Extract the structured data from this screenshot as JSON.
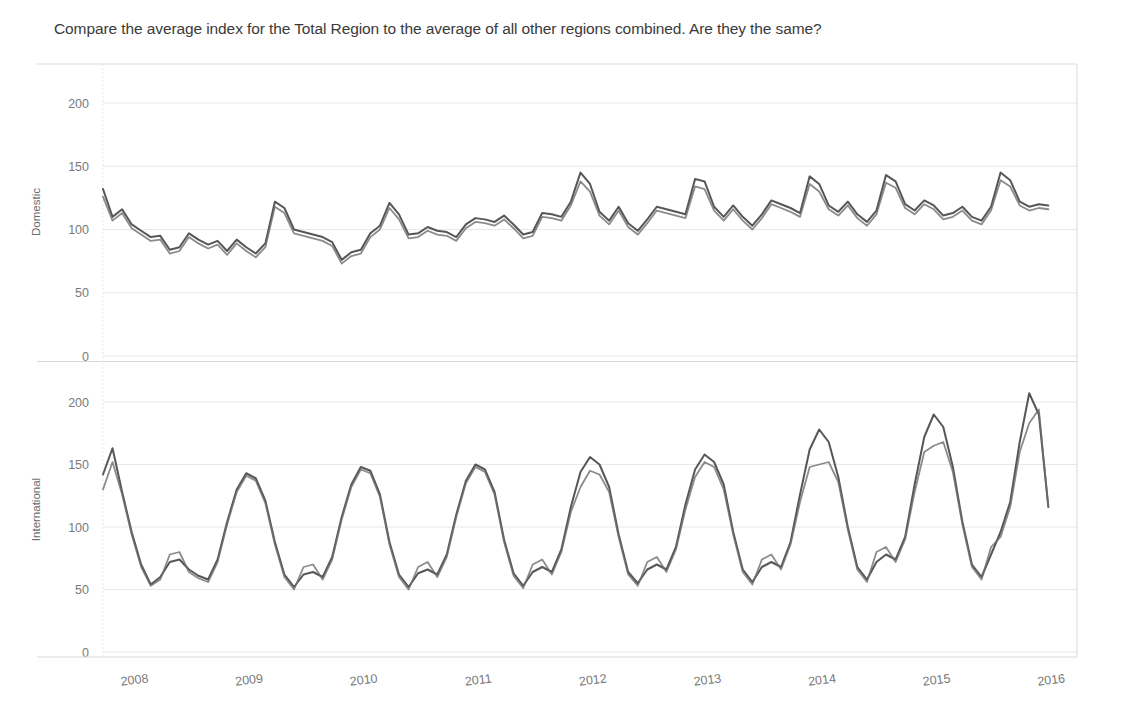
{
  "question": {
    "text": "Compare the average index for the Total Region to the average of all other regions combined. Are they the same?"
  },
  "colors": {
    "series_total": "#4d4d4d",
    "series_other": "#6e6e6e",
    "gridline": "#e8e8e8",
    "axis_line": "#d9d9d9",
    "tick_text": "#7a7a7a",
    "background": "#ffffff"
  },
  "chart_data": {
    "type": "line",
    "title": "",
    "xlabel": "",
    "grid": true,
    "legend_position": "none",
    "x_tick_labels": [
      "2008",
      "2009",
      "2010",
      "2011",
      "2012",
      "2013",
      "2014",
      "2015",
      "2016"
    ],
    "x_tick_values": [
      2008,
      2009,
      2010,
      2011,
      2012,
      2013,
      2014,
      2015,
      2016
    ],
    "xlim": [
      2008.0,
      2016.5
    ],
    "panels": [
      {
        "ylabel": "Domestic",
        "ylim": [
          0,
          225
        ],
        "y_tick_labels": [
          "0",
          "50",
          "100",
          "150",
          "200"
        ],
        "y_tick_values": [
          0,
          50,
          100,
          150,
          200
        ],
        "series": [
          {
            "name": "Total Region",
            "color": "#4d4d4d",
            "x": [
              2008.0,
              2008.083,
              2008.167,
              2008.25,
              2008.333,
              2008.417,
              2008.5,
              2008.583,
              2008.667,
              2008.75,
              2008.833,
              2008.917,
              2009.0,
              2009.083,
              2009.167,
              2009.25,
              2009.333,
              2009.417,
              2009.5,
              2009.583,
              2009.667,
              2009.75,
              2009.833,
              2009.917,
              2010.0,
              2010.083,
              2010.167,
              2010.25,
              2010.333,
              2010.417,
              2010.5,
              2010.583,
              2010.667,
              2010.75,
              2010.833,
              2010.917,
              2011.0,
              2011.083,
              2011.167,
              2011.25,
              2011.333,
              2011.417,
              2011.5,
              2011.583,
              2011.667,
              2011.75,
              2011.833,
              2011.917,
              2012.0,
              2012.083,
              2012.167,
              2012.25,
              2012.333,
              2012.417,
              2012.5,
              2012.583,
              2012.667,
              2012.75,
              2012.833,
              2012.917,
              2013.0,
              2013.083,
              2013.167,
              2013.25,
              2013.333,
              2013.417,
              2013.5,
              2013.583,
              2013.667,
              2013.75,
              2013.833,
              2013.917,
              2014.0,
              2014.083,
              2014.167,
              2014.25,
              2014.333,
              2014.417,
              2014.5,
              2014.583,
              2014.667,
              2014.75,
              2014.833,
              2014.917,
              2015.0,
              2015.083,
              2015.167,
              2015.25,
              2015.333,
              2015.417,
              2015.5,
              2015.583,
              2015.667,
              2015.75,
              2015.833,
              2015.917,
              2016.0,
              2016.083,
              2016.167,
              2016.25
            ],
            "values": [
              132,
              110,
              116,
              104,
              99,
              94,
              95,
              84,
              86,
              97,
              92,
              88,
              91,
              83,
              92,
              86,
              81,
              89,
              122,
              117,
              100,
              98,
              96,
              94,
              90,
              76,
              82,
              84,
              97,
              103,
              121,
              112,
              96,
              97,
              102,
              99,
              98,
              94,
              104,
              109,
              108,
              106,
              111,
              104,
              96,
              98,
              113,
              112,
              110,
              122,
              145,
              136,
              114,
              107,
              118,
              105,
              99,
              108,
              118,
              116,
              114,
              112,
              140,
              138,
              118,
              110,
              119,
              110,
              103,
              112,
              123,
              120,
              117,
              113,
              142,
              136,
              119,
              114,
              122,
              112,
              106,
              115,
              143,
              138,
              120,
              115,
              123,
              119,
              111,
              113,
              118,
              110,
              107,
              118,
              145,
              139,
              122,
              118,
              120,
              119
            ]
          },
          {
            "name": "All Other Regions",
            "color": "#6e6e6e",
            "x": [
              2008.0,
              2008.083,
              2008.167,
              2008.25,
              2008.333,
              2008.417,
              2008.5,
              2008.583,
              2008.667,
              2008.75,
              2008.833,
              2008.917,
              2009.0,
              2009.083,
              2009.167,
              2009.25,
              2009.333,
              2009.417,
              2009.5,
              2009.583,
              2009.667,
              2009.75,
              2009.833,
              2009.917,
              2010.0,
              2010.083,
              2010.167,
              2010.25,
              2010.333,
              2010.417,
              2010.5,
              2010.583,
              2010.667,
              2010.75,
              2010.833,
              2010.917,
              2011.0,
              2011.083,
              2011.167,
              2011.25,
              2011.333,
              2011.417,
              2011.5,
              2011.583,
              2011.667,
              2011.75,
              2011.833,
              2011.917,
              2012.0,
              2012.083,
              2012.167,
              2012.25,
              2012.333,
              2012.417,
              2012.5,
              2012.583,
              2012.667,
              2012.75,
              2012.833,
              2012.917,
              2013.0,
              2013.083,
              2013.167,
              2013.25,
              2013.333,
              2013.417,
              2013.5,
              2013.583,
              2013.667,
              2013.75,
              2013.833,
              2013.917,
              2014.0,
              2014.083,
              2014.167,
              2014.25,
              2014.333,
              2014.417,
              2014.5,
              2014.583,
              2014.667,
              2014.75,
              2014.833,
              2014.917,
              2015.0,
              2015.083,
              2015.167,
              2015.25,
              2015.333,
              2015.417,
              2015.5,
              2015.583,
              2015.667,
              2015.75,
              2015.833,
              2015.917,
              2016.0,
              2016.083,
              2016.167,
              2016.25
            ],
            "values": [
              126,
              107,
              113,
              101,
              96,
              91,
              92,
              81,
              83,
              94,
              89,
              85,
              88,
              80,
              89,
              83,
              78,
              86,
              118,
              113,
              97,
              95,
              93,
              91,
              87,
              73,
              79,
              81,
              94,
              100,
              117,
              108,
              93,
              94,
              99,
              96,
              95,
              91,
              101,
              106,
              105,
              103,
              108,
              101,
              93,
              95,
              110,
              109,
              107,
              119,
              138,
              130,
              111,
              104,
              115,
              102,
              96,
              105,
              115,
              113,
              111,
              109,
              134,
              132,
              115,
              107,
              116,
              107,
              100,
              109,
              120,
              117,
              114,
              110,
              136,
              130,
              116,
              111,
              119,
              109,
              103,
              112,
              137,
              133,
              117,
              112,
              120,
              116,
              108,
              110,
              115,
              107,
              104,
              115,
              139,
              134,
              119,
              115,
              117,
              116
            ]
          }
        ]
      },
      {
        "ylabel": "International",
        "ylim": [
          0,
          225
        ],
        "y_tick_labels": [
          "0",
          "50",
          "100",
          "150",
          "200"
        ],
        "y_tick_values": [
          0,
          50,
          100,
          150,
          200
        ],
        "series": [
          {
            "name": "Total Region",
            "color": "#4d4d4d",
            "x": [
              2008.0,
              2008.083,
              2008.167,
              2008.25,
              2008.333,
              2008.417,
              2008.5,
              2008.583,
              2008.667,
              2008.75,
              2008.833,
              2008.917,
              2009.0,
              2009.083,
              2009.167,
              2009.25,
              2009.333,
              2009.417,
              2009.5,
              2009.583,
              2009.667,
              2009.75,
              2009.833,
              2009.917,
              2010.0,
              2010.083,
              2010.167,
              2010.25,
              2010.333,
              2010.417,
              2010.5,
              2010.583,
              2010.667,
              2010.75,
              2010.833,
              2010.917,
              2011.0,
              2011.083,
              2011.167,
              2011.25,
              2011.333,
              2011.417,
              2011.5,
              2011.583,
              2011.667,
              2011.75,
              2011.833,
              2011.917,
              2012.0,
              2012.083,
              2012.167,
              2012.25,
              2012.333,
              2012.417,
              2012.5,
              2012.583,
              2012.667,
              2012.75,
              2012.833,
              2012.917,
              2013.0,
              2013.083,
              2013.167,
              2013.25,
              2013.333,
              2013.417,
              2013.5,
              2013.583,
              2013.667,
              2013.75,
              2013.833,
              2013.917,
              2014.0,
              2014.083,
              2014.167,
              2014.25,
              2014.333,
              2014.417,
              2014.5,
              2014.583,
              2014.667,
              2014.75,
              2014.833,
              2014.917,
              2015.0,
              2015.083,
              2015.167,
              2015.25,
              2015.333,
              2015.417,
              2015.5,
              2015.583,
              2015.667,
              2015.75,
              2015.833,
              2015.917,
              2016.0,
              2016.083,
              2016.167,
              2016.25
            ],
            "values": [
              142,
              163,
              128,
              96,
              70,
              54,
              60,
              72,
              74,
              66,
              61,
              58,
              74,
              104,
              130,
              143,
              139,
              121,
              88,
              62,
              52,
              62,
              64,
              60,
              76,
              108,
              134,
              148,
              145,
              126,
              88,
              62,
              52,
              63,
              66,
              62,
              78,
              110,
              137,
              150,
              146,
              128,
              90,
              63,
              53,
              64,
              68,
              64,
              82,
              116,
              144,
              156,
              150,
              132,
              94,
              64,
              55,
              66,
              70,
              66,
              84,
              118,
              146,
              158,
              152,
              134,
              96,
              66,
              56,
              68,
              72,
              68,
              88,
              126,
              162,
              178,
              168,
              140,
              100,
              68,
              58,
              72,
              78,
              74,
              92,
              134,
              172,
              190,
              180,
              148,
              104,
              70,
              60,
              78,
              96,
              120,
              168,
              207,
              190,
              116
            ]
          },
          {
            "name": "All Other Regions",
            "color": "#6e6e6e",
            "x": [
              2008.0,
              2008.083,
              2008.167,
              2008.25,
              2008.333,
              2008.417,
              2008.5,
              2008.583,
              2008.667,
              2008.75,
              2008.833,
              2008.917,
              2009.0,
              2009.083,
              2009.167,
              2009.25,
              2009.333,
              2009.417,
              2009.5,
              2009.583,
              2009.667,
              2009.75,
              2009.833,
              2009.917,
              2010.0,
              2010.083,
              2010.167,
              2010.25,
              2010.333,
              2010.417,
              2010.5,
              2010.583,
              2010.667,
              2010.75,
              2010.833,
              2010.917,
              2011.0,
              2011.083,
              2011.167,
              2011.25,
              2011.333,
              2011.417,
              2011.5,
              2011.583,
              2011.667,
              2011.75,
              2011.833,
              2011.917,
              2012.0,
              2012.083,
              2012.167,
              2012.25,
              2012.333,
              2012.417,
              2012.5,
              2012.583,
              2012.667,
              2012.75,
              2012.833,
              2012.917,
              2013.0,
              2013.083,
              2013.167,
              2013.25,
              2013.333,
              2013.417,
              2013.5,
              2013.583,
              2013.667,
              2013.75,
              2013.833,
              2013.917,
              2014.0,
              2014.083,
              2014.167,
              2014.25,
              2014.333,
              2014.417,
              2014.5,
              2014.583,
              2014.667,
              2014.75,
              2014.833,
              2014.917,
              2015.0,
              2015.083,
              2015.167,
              2015.25,
              2015.333,
              2015.417,
              2015.5,
              2015.583,
              2015.667,
              2015.75,
              2015.833,
              2015.917,
              2016.0,
              2016.083,
              2016.167,
              2016.25
            ],
            "values": [
              130,
              152,
              126,
              94,
              68,
              53,
              58,
              78,
              80,
              64,
              59,
              56,
              72,
              102,
              128,
              141,
              137,
              119,
              86,
              60,
              50,
              68,
              70,
              58,
              74,
              106,
              132,
              146,
              143,
              124,
              86,
              60,
              50,
              68,
              72,
              60,
              76,
              108,
              135,
              148,
              144,
              126,
              88,
              61,
              51,
              70,
              74,
              62,
              80,
              112,
              132,
              145,
              142,
              128,
              92,
              62,
              53,
              72,
              76,
              64,
              82,
              114,
              140,
              152,
              148,
              130,
              94,
              64,
              54,
              74,
              78,
              66,
              86,
              120,
              148,
              150,
              152,
              136,
              98,
              66,
              56,
              80,
              84,
              72,
              90,
              128,
              160,
              165,
              168,
              144,
              102,
              68,
              58,
              84,
              92,
              116,
              160,
              183,
              194,
              116
            ]
          }
        ]
      }
    ]
  }
}
